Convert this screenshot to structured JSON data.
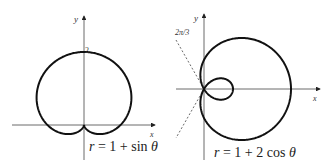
{
  "chart_data": [
    {
      "type": "line",
      "title": "",
      "equation": "r = 1 + sin θ",
      "curve": "cardioid",
      "xlabel": "x",
      "ylabel": "y",
      "annotations": [
        "2"
      ],
      "key_points": [
        {
          "theta": "π/2",
          "r": 2,
          "x": 0,
          "y": 2
        },
        {
          "theta": "0",
          "r": 1,
          "x": 1,
          "y": 0
        },
        {
          "theta": "π",
          "r": 1,
          "x": -1,
          "y": 0
        },
        {
          "theta": "3π/2",
          "r": 0,
          "x": 0,
          "y": 0
        }
      ]
    },
    {
      "type": "line",
      "title": "",
      "equation": "r = 1 + 2 cos θ",
      "curve": "limaçon with inner loop",
      "xlabel": "x",
      "ylabel": "y",
      "annotations": [
        "2π/3"
      ],
      "dashed_lines": [
        "θ = 2π/3",
        "θ = 4π/3"
      ],
      "key_points": [
        {
          "theta": "0",
          "r": 3,
          "x": 3,
          "y": 0
        },
        {
          "theta": "π",
          "r": -1,
          "x": 1,
          "y": 0
        },
        {
          "theta": "2π/3",
          "r": 0,
          "x": 0,
          "y": 0
        }
      ]
    }
  ],
  "left": {
    "y_axis_label": "y",
    "x_axis_label": "x",
    "tick_label": "2",
    "equation": "r = 1 + sin θ"
  },
  "right": {
    "y_axis_label": "y",
    "x_axis_label": "x",
    "angle_label": "2π/3",
    "equation": "r = 1 + 2 cos θ"
  }
}
